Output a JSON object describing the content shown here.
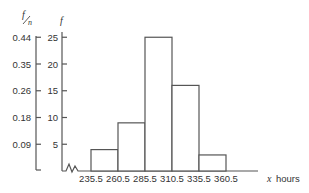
{
  "chart_data": {
    "type": "bar",
    "subtype": "histogram",
    "title": "",
    "xlabel": "x hours",
    "ylabel": "f",
    "ylabel_secondary": "f/n",
    "bin_edges": [
      235.5,
      260.5,
      285.5,
      310.5,
      335.5,
      360.5
    ],
    "categories": [
      "235.5–260.5",
      "260.5–285.5",
      "285.5–310.5",
      "310.5–335.5",
      "335.5–360.5"
    ],
    "values": [
      4,
      9,
      25,
      16,
      3
    ],
    "n": 57,
    "ylim": [
      0,
      25
    ],
    "y_ticks": [
      5,
      10,
      15,
      20,
      25
    ],
    "y_ticks_secondary": [
      "0.09",
      "0.18",
      "0.26",
      "0.35",
      "0.44"
    ],
    "x_tick_labels": [
      "235.5",
      "260.5",
      "285.5",
      "310.5",
      "335.5",
      "360.5"
    ],
    "axis_break": true,
    "grid": false,
    "legend": null
  },
  "labels": {
    "f_over_n_num": "f",
    "f_over_n_den": "n",
    "f": "f",
    "x_var": "x",
    "x_unit": "hours"
  }
}
